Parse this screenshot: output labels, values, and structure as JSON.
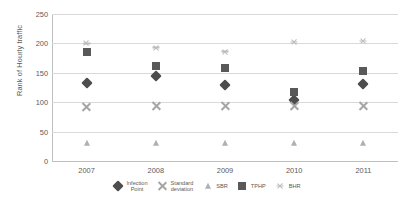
{
  "chart_data": {
    "type": "scatter",
    "title": "",
    "xlabel": "",
    "ylabel": "Rank of Hourly traffic",
    "categories": [
      "2007",
      "2008",
      "2009",
      "2010",
      "2011"
    ],
    "ylim": [
      0,
      250
    ],
    "yticks": [
      0,
      50,
      100,
      150,
      200,
      250
    ],
    "grid": true,
    "legend_position": "bottom",
    "series": [
      {
        "name": "Infection Point",
        "name_line1": "Infection",
        "name_line2": "Point",
        "marker": "diamond",
        "color": "#4d4d4d",
        "values": [
          132,
          144,
          130,
          103,
          131
        ]
      },
      {
        "name": "Standard deviation",
        "name_line1": "Standard",
        "name_line2": "deviation",
        "marker": "cross",
        "color": "#a6a6a6",
        "values": [
          92,
          93,
          93,
          93,
          93
        ]
      },
      {
        "name": "SBR",
        "name_line1": "SBR",
        "name_line2": "",
        "marker": "triangle",
        "color": "#b0b0b0",
        "values": [
          30,
          30,
          31,
          31,
          31
        ]
      },
      {
        "name": "TPHP",
        "name_line1": "TPHP",
        "name_line2": "",
        "marker": "square",
        "color": "#595959",
        "values": [
          185,
          161,
          158,
          118,
          153
        ]
      },
      {
        "name": "BHR",
        "name_line1": "BHR",
        "name_line2": "",
        "marker": "star",
        "color": "#bdbdbd",
        "values": [
          200,
          193,
          186,
          202,
          204
        ]
      }
    ]
  },
  "colors": {
    "gridline": "#d9d9d9",
    "axis": "#bfbfbf",
    "text": "#5a5a5a",
    "background": "#ffffff"
  }
}
